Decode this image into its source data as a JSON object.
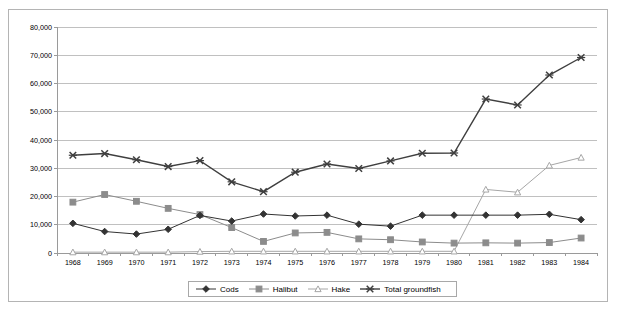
{
  "chart_data": {
    "type": "line",
    "title": "",
    "xlabel": "",
    "ylabel": "",
    "categories": [
      "1968",
      "1969",
      "1970",
      "1971",
      "1972",
      "1973",
      "1974",
      "1975",
      "1976",
      "1977",
      "1978",
      "1979",
      "1980",
      "1981",
      "1982",
      "1983",
      "1984"
    ],
    "yticks": [
      "0",
      "10,000",
      "20,000",
      "30,000",
      "40,000",
      "50,000",
      "60,000",
      "70,000",
      "80,000"
    ],
    "ytick_values": [
      0,
      10000,
      20000,
      30000,
      40000,
      50000,
      60000,
      70000,
      80000
    ],
    "ylim": [
      0,
      80000
    ],
    "grid": true,
    "legend_position": "bottom",
    "series": [
      {
        "name": "Cods",
        "marker": "diamond",
        "color": "#333333",
        "values": [
          10500,
          7600,
          6700,
          8400,
          13300,
          11300,
          13800,
          13100,
          13400,
          10200,
          9500,
          13400,
          13400,
          13400,
          13400,
          13700,
          11800
        ]
      },
      {
        "name": "Halibut",
        "marker": "square",
        "color": "#8c8c8c",
        "values": [
          18000,
          20700,
          18300,
          15800,
          13600,
          9000,
          4100,
          7100,
          7300,
          5000,
          4700,
          3900,
          3500,
          3600,
          3500,
          3700,
          5300
        ]
      },
      {
        "name": "Hake",
        "marker": "triangle",
        "color": "#a6a6a6",
        "values": [
          300,
          300,
          300,
          300,
          500,
          600,
          600,
          600,
          600,
          600,
          600,
          600,
          600,
          22500,
          21500,
          31000,
          33800
        ]
      },
      {
        "name": "Total groundfish",
        "marker": "cross",
        "color": "#3f3f3f",
        "values": [
          34600,
          35200,
          33000,
          30600,
          32700,
          25200,
          21700,
          28600,
          31500,
          29900,
          32600,
          35300,
          35400,
          54500,
          52400,
          63000,
          69200
        ]
      }
    ]
  },
  "legend": {
    "items": [
      {
        "label": "Cods",
        "marker": "diamond"
      },
      {
        "label": "Halibut",
        "marker": "square"
      },
      {
        "label": "Hake",
        "marker": "triangle"
      },
      {
        "label": "Total groundfish",
        "marker": "cross"
      }
    ]
  }
}
